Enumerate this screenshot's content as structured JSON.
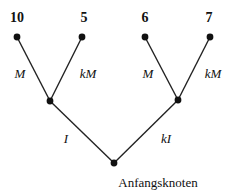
{
  "diagram": {
    "type": "decision-tree",
    "leaves": [
      {
        "id": "leaf-1",
        "value": "10",
        "x": 17,
        "y": 37,
        "lx": 17,
        "ly": 18
      },
      {
        "id": "leaf-2",
        "value": "5",
        "x": 82,
        "y": 37,
        "lx": 84,
        "ly": 18
      },
      {
        "id": "leaf-3",
        "value": "6",
        "x": 145,
        "y": 37,
        "lx": 145,
        "ly": 18
      },
      {
        "id": "leaf-4",
        "value": "7",
        "x": 210,
        "y": 37,
        "lx": 209,
        "ly": 18
      }
    ],
    "inner_nodes": [
      {
        "id": "node-left",
        "x": 50,
        "y": 101
      },
      {
        "id": "node-right",
        "x": 178,
        "y": 100
      }
    ],
    "root": {
      "id": "root",
      "x": 114,
      "y": 163,
      "label": "Anfangsknoten",
      "lx": 158,
      "ly": 183
    },
    "edges": [
      {
        "from": "node-left",
        "to": "leaf-1",
        "label": "M",
        "lx": 20,
        "ly": 74
      },
      {
        "from": "node-left",
        "to": "leaf-2",
        "label": "kM",
        "lx": 88,
        "ly": 74
      },
      {
        "from": "node-right",
        "to": "leaf-3",
        "label": "M",
        "lx": 148,
        "ly": 74
      },
      {
        "from": "node-right",
        "to": "leaf-4",
        "label": "kM",
        "lx": 213,
        "ly": 74
      },
      {
        "from": "root",
        "to": "node-left",
        "label": "I",
        "lx": 66,
        "ly": 139
      },
      {
        "from": "root",
        "to": "node-right",
        "label": "kI",
        "lx": 166,
        "ly": 139
      }
    ]
  }
}
